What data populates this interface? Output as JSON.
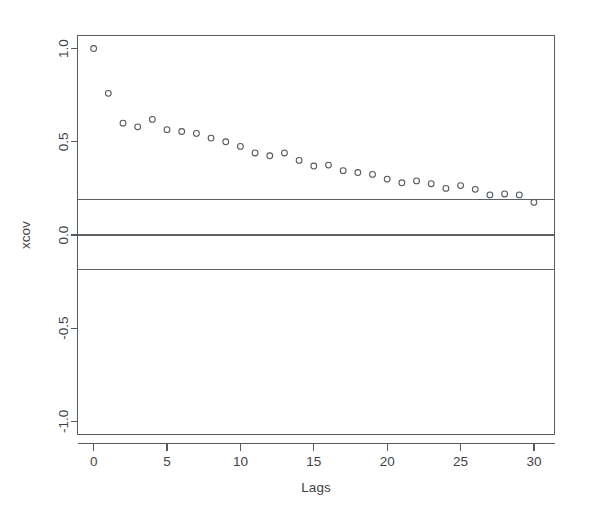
{
  "chart_data": {
    "type": "scatter",
    "title": "",
    "subtitle": "",
    "xlabel": "Lags",
    "ylabel": "xcov",
    "xlim": [
      -1.1,
      31.4
    ],
    "ylim": [
      -1.07,
      1.07
    ],
    "grid": false,
    "legend": false,
    "legend_position": "none",
    "x": [
      0,
      1,
      2,
      3,
      4,
      5,
      6,
      7,
      8,
      9,
      10,
      11,
      12,
      13,
      14,
      15,
      16,
      17,
      18,
      19,
      20,
      21,
      22,
      23,
      24,
      25,
      26,
      27,
      28,
      29,
      30
    ],
    "values": [
      1.0,
      0.76,
      0.6,
      0.58,
      0.62,
      0.565,
      0.555,
      0.545,
      0.52,
      0.5,
      0.475,
      0.44,
      0.425,
      0.44,
      0.4,
      0.37,
      0.375,
      0.345,
      0.335,
      0.325,
      0.3,
      0.28,
      0.29,
      0.275,
      0.25,
      0.265,
      0.245,
      0.215,
      0.22,
      0.215,
      0.175
    ],
    "series": [
      {
        "name": "xcov",
        "marker": "open-circle",
        "color": "#53585d",
        "values": [
          1.0,
          0.76,
          0.6,
          0.58,
          0.62,
          0.565,
          0.555,
          0.545,
          0.52,
          0.5,
          0.475,
          0.44,
          0.425,
          0.44,
          0.4,
          0.37,
          0.375,
          0.345,
          0.335,
          0.325,
          0.3,
          0.28,
          0.29,
          0.275,
          0.25,
          0.265,
          0.245,
          0.215,
          0.22,
          0.215,
          0.175
        ]
      }
    ],
    "reference_lines": [
      {
        "name": "upper-confidence-bound",
        "y": 0.19
      },
      {
        "name": "zero-line",
        "y": 0.0
      },
      {
        "name": "lower-confidence-bound",
        "y": -0.185
      }
    ],
    "xticks": [
      0,
      5,
      10,
      15,
      20,
      25,
      30
    ],
    "xticklabels": [
      "0",
      "5",
      "10",
      "15",
      "20",
      "25",
      "30"
    ],
    "yticks": [
      1.0,
      0.5,
      0.0,
      -0.5,
      -1.0
    ],
    "yticklabels": [
      "1.0",
      "0.5",
      "0.0",
      "-0.5",
      "-1.0"
    ]
  },
  "style": {
    "background": "#ffffff",
    "axis_color": "#555a5e",
    "marker_color": "#53585d",
    "text_color": "#3f4346"
  }
}
